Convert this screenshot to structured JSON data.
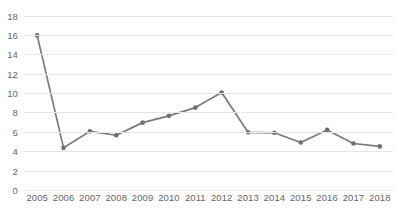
{
  "chart_data": {
    "type": "line",
    "title": "",
    "xlabel": "",
    "ylabel": "",
    "categories": [
      "2005",
      "2006",
      "2007",
      "2008",
      "2009",
      "2010",
      "2011",
      "2012",
      "2013",
      "2014",
      "2015",
      "2016",
      "2017",
      "2018"
    ],
    "values": [
      16.0,
      4.4,
      6.1,
      5.7,
      7.0,
      7.7,
      8.55,
      10.1,
      6.0,
      5.95,
      4.95,
      6.25,
      4.85,
      4.55
    ],
    "series": [
      {
        "name": "Series 1",
        "values": [
          16.0,
          4.4,
          6.1,
          5.7,
          7.0,
          7.7,
          8.55,
          10.1,
          6.0,
          5.95,
          4.95,
          6.25,
          4.85,
          4.55
        ]
      }
    ],
    "ylim": [
      0,
      18
    ],
    "y_ticks": [
      0,
      2,
      4,
      6,
      8,
      10,
      12,
      14,
      16,
      18
    ],
    "y_tick_labels": [
      "0",
      "2",
      "4",
      "6",
      "8",
      "10",
      "12",
      "14",
      "16",
      "18"
    ],
    "x_tick_labels": [
      "2005",
      "2006",
      "2007",
      "2008",
      "2009",
      "2010",
      "2011",
      "2012",
      "2013",
      "2014",
      "2015",
      "2016",
      "2017",
      "2018"
    ],
    "grid": true,
    "grid_axis": "y",
    "legend": false,
    "legend_position": "none",
    "markers": true,
    "annotations": []
  },
  "style": {
    "line_color": "#7a7a7a",
    "marker_color": "#6e6e6e",
    "grid_color": "#e6e6e6",
    "axis_label_color": "#666666",
    "background": "#ffffff"
  }
}
